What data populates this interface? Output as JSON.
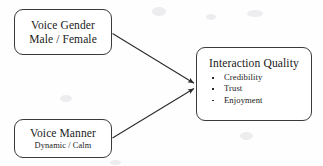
{
  "diagram": {
    "type": "conceptual-model",
    "background_color": "#fefefe",
    "stroke_color": "#3a3a3a",
    "nodes": [
      {
        "id": "voice-gender",
        "role": "independent-variable",
        "primary_label": "Voice Gender",
        "secondary_label": "Male / Female",
        "levels": [
          "Male",
          "Female"
        ]
      },
      {
        "id": "voice-manner",
        "role": "independent-variable",
        "primary_label": "Voice Manner",
        "secondary_label": "Dynamic / Calm",
        "levels": [
          "Dynamic",
          "Calm"
        ]
      },
      {
        "id": "interaction-quality",
        "role": "dependent-variable",
        "title": "Interaction Quality",
        "items": [
          "Credibility",
          "Trust",
          "Enjoyment"
        ]
      }
    ],
    "edges": [
      {
        "id": "edge-gender-to-quality",
        "from": "voice-gender",
        "to": "interaction-quality",
        "arrowhead": "filled-triangle"
      },
      {
        "id": "edge-manner-to-quality",
        "from": "voice-manner",
        "to": "interaction-quality",
        "arrowhead": "filled-triangle"
      }
    ]
  }
}
